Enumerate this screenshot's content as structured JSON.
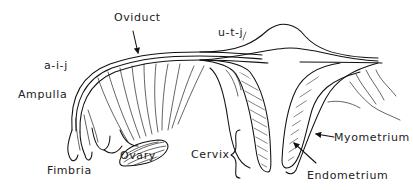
{
  "diagram": {
    "type": "anatomical-line-drawing",
    "ink_color": "#111111",
    "background": "#ffffff",
    "labels": {
      "oviduct": "Oviduct",
      "aij": "a-i-j",
      "utj": "u-t-j",
      "ampulla": "Ampulla",
      "fimbria": "Fimbria",
      "ovary": "Ovary",
      "cervix": "Cervix",
      "myometrium": "Myometrium",
      "endometrium": "Endometrium"
    },
    "pointers": [
      {
        "from": "Oviduct",
        "to": "oviduct-wall",
        "kind": "arrow"
      },
      {
        "from": "Myometrium",
        "to": "uterine-wall-outer",
        "kind": "arrow"
      },
      {
        "from": "Endometrium",
        "to": "uterine-lining",
        "kind": "arrow"
      },
      {
        "from": "Cervix",
        "to": "cervical-region",
        "kind": "brace"
      }
    ]
  }
}
